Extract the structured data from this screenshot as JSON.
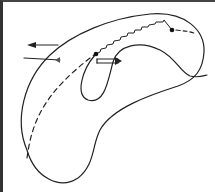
{
  "diagram": {
    "title": "",
    "colors": {
      "stroke": "#222222",
      "border": "#333333",
      "background": "#ffffff"
    },
    "elements": [
      {
        "id": "outer-body",
        "type": "closed-curve",
        "style": "solid",
        "description": "large kidney/bean shaped outer boundary"
      },
      {
        "id": "inner-loop",
        "type": "open-curve",
        "style": "solid",
        "description": "inner teardrop loop extending to lower right tail"
      },
      {
        "id": "dashed-path",
        "type": "curve",
        "style": "dashed",
        "description": "dashed arc from lower left to inner point"
      },
      {
        "id": "zigzag-path",
        "type": "curve",
        "style": "zigzag",
        "description": "stepped/sawtooth path between two points"
      },
      {
        "id": "point-a",
        "type": "dot",
        "description": "point at start of zigzag"
      },
      {
        "id": "point-b",
        "type": "dot",
        "description": "point at end of zigzag"
      },
      {
        "id": "arrow-left",
        "type": "arrow",
        "direction": "left"
      },
      {
        "id": "arrow-right-line",
        "type": "arrow",
        "direction": "right"
      },
      {
        "id": "double-arrow-right",
        "type": "hollow-arrow",
        "direction": "right"
      }
    ]
  }
}
